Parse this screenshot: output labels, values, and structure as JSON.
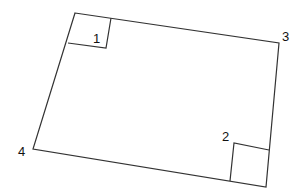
{
  "diagram": {
    "stroke_color": "#333333",
    "label_color": "#111111",
    "corners": [
      {
        "label": "1",
        "x": 75,
        "y": 13
      },
      {
        "label": "3",
        "x": 279,
        "y": 43
      },
      {
        "label": "2",
        "x": 266,
        "y": 187
      },
      {
        "label": "4",
        "x": 33,
        "y": 149
      }
    ],
    "labels": {
      "c1": "1",
      "c2": "2",
      "c3": "3",
      "c4": "4"
    },
    "right_angle_markers": [
      {
        "at_corner": "1"
      },
      {
        "at_corner": "2"
      }
    ]
  }
}
